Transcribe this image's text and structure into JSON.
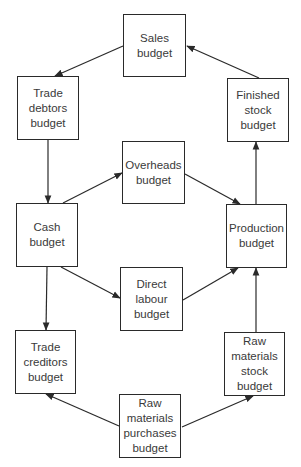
{
  "diagram": {
    "type": "budget-relationships-flow",
    "nodes": [
      {
        "id": "sales",
        "label": "Sales\nbudget",
        "x": 123,
        "y": 14,
        "w": 63,
        "h": 63
      },
      {
        "id": "trade_debtors",
        "label": "Trade\ndebtors\nbudget",
        "x": 17,
        "y": 76,
        "w": 62,
        "h": 64
      },
      {
        "id": "finished_stock",
        "label": "Finished\nstock\nbudget",
        "x": 227,
        "y": 78,
        "w": 62,
        "h": 64
      },
      {
        "id": "overheads",
        "label": "Overheads\nbudget",
        "x": 122,
        "y": 141,
        "w": 63,
        "h": 63
      },
      {
        "id": "cash",
        "label": "Cash\nbudget",
        "x": 16,
        "y": 203,
        "w": 62,
        "h": 64
      },
      {
        "id": "production",
        "label": "Production\nbudget",
        "x": 226,
        "y": 204,
        "w": 61,
        "h": 64
      },
      {
        "id": "direct_labour",
        "label": "Direct\nlabour\nbudget",
        "x": 120,
        "y": 267,
        "w": 63,
        "h": 64
      },
      {
        "id": "trade_creditors",
        "label": "Trade\ncreditors\nbudget",
        "x": 15,
        "y": 330,
        "w": 61,
        "h": 64
      },
      {
        "id": "raw_materials_stock",
        "label": "Raw\nmaterials\nstock\nbudget",
        "x": 224,
        "y": 332,
        "w": 61,
        "h": 64
      },
      {
        "id": "raw_materials_purchases",
        "label": "Raw\nmaterials\npurchases\nbudget",
        "x": 119,
        "y": 394,
        "w": 62,
        "h": 64
      }
    ],
    "edges": [
      {
        "from": "sales",
        "to": "trade_debtors",
        "x1": 123,
        "y1": 46,
        "x2": 55,
        "y2": 76
      },
      {
        "from": "finished_stock",
        "to": "sales",
        "x1": 259,
        "y1": 78,
        "x2": 187,
        "y2": 46
      },
      {
        "from": "trade_debtors",
        "to": "cash",
        "x1": 48,
        "y1": 140,
        "x2": 48,
        "y2": 203
      },
      {
        "from": "cash",
        "to": "overheads",
        "x1": 63,
        "y1": 203,
        "x2": 122,
        "y2": 173
      },
      {
        "from": "overheads",
        "to": "production",
        "x1": 185,
        "y1": 174,
        "x2": 240,
        "y2": 204
      },
      {
        "from": "production",
        "to": "finished_stock",
        "x1": 256,
        "y1": 204,
        "x2": 256,
        "y2": 142
      },
      {
        "from": "cash",
        "to": "direct_labour",
        "x1": 61,
        "y1": 267,
        "x2": 120,
        "y2": 298
      },
      {
        "from": "direct_labour",
        "to": "production",
        "x1": 183,
        "y1": 300,
        "x2": 238,
        "y2": 268
      },
      {
        "from": "cash",
        "to": "trade_creditors",
        "x1": 47,
        "y1": 267,
        "x2": 46,
        "y2": 330
      },
      {
        "from": "raw_materials_stock",
        "to": "production",
        "x1": 256,
        "y1": 332,
        "x2": 256,
        "y2": 268
      },
      {
        "from": "raw_materials_purchases",
        "to": "trade_creditors",
        "x1": 119,
        "y1": 426,
        "x2": 46,
        "y2": 394
      },
      {
        "from": "raw_materials_purchases",
        "to": "raw_materials_stock",
        "x1": 182,
        "y1": 427,
        "x2": 253,
        "y2": 396
      }
    ],
    "colors": {
      "line": "#2a2a2a",
      "text": "#3a3a3a",
      "background": "#ffffff"
    }
  }
}
